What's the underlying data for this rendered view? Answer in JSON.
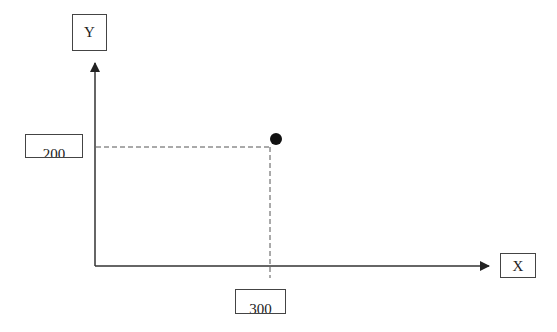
{
  "diagram": {
    "axis_labels": {
      "y": "Y",
      "x": "X"
    },
    "point": {
      "x": 300,
      "y": 200
    },
    "tick_labels": {
      "x_value": "300",
      "y_value": "200"
    },
    "colors": {
      "axis": "#333333",
      "guide": "#555555",
      "point": "#111111"
    }
  }
}
